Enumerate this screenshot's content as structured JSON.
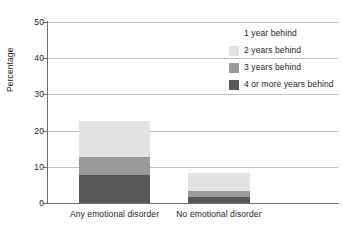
{
  "chart_data": {
    "type": "bar",
    "subtype": "stacked-bar",
    "title": "",
    "xlabel": "",
    "ylabel": "Percentage",
    "ylim": [
      0,
      50
    ],
    "yticks": [
      0,
      10,
      20,
      30,
      40,
      50
    ],
    "ytick_labels": [
      "0",
      "10",
      "20",
      "30",
      "40",
      "50"
    ],
    "grid": true,
    "grid_axis": "y",
    "legend_position": "upper right",
    "categories": [
      "Any emotional disorder",
      "No emotional disorder"
    ],
    "series": [
      {
        "name": "1 year behind",
        "color": "#ffffff",
        "values": [
          0,
          0
        ]
      },
      {
        "name": "2 years behind",
        "color": "#e2e2e2",
        "values": [
          10.0,
          5.0
        ]
      },
      {
        "name": "3 years behind",
        "color": "#9a9a9a",
        "values": [
          5.0,
          1.5
        ]
      },
      {
        "name": "4 or more years behind",
        "color": "#585858",
        "values": [
          7.75,
          1.75
        ]
      }
    ],
    "stack_order_bottom_to_top": [
      "4 or more years behind",
      "3 years behind",
      "2 years behind",
      "1 year behind"
    ],
    "totals": [
      22.75,
      8.25
    ]
  },
  "axes": {
    "y_title": "Percentage",
    "y_ticks": [
      {
        "value": 50,
        "label": "50"
      },
      {
        "value": 40,
        "label": "40"
      },
      {
        "value": 30,
        "label": "30"
      },
      {
        "value": 20,
        "label": "20"
      },
      {
        "value": 10,
        "label": "10"
      },
      {
        "value": 0,
        "label": "0"
      }
    ],
    "x_categories": [
      {
        "label": "Any emotional disorder"
      },
      {
        "label": "No emotional disorder"
      }
    ]
  },
  "legend": {
    "items": [
      {
        "label": "1 year behind",
        "color": "#ffffff"
      },
      {
        "label": "2 years behind",
        "color": "#e2e2e2"
      },
      {
        "label": "3 years behind",
        "color": "#9a9a9a"
      },
      {
        "label": "4 or more years behind",
        "color": "#585858"
      }
    ]
  },
  "colors": {
    "axis": "#6d6e71",
    "grid": "#bfc0c2",
    "text": "#231f20",
    "background": "#ffffff"
  }
}
